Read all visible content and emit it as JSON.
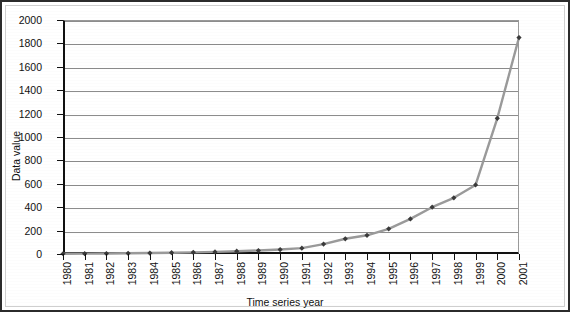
{
  "chart_data": {
    "type": "line",
    "title": "",
    "xlabel": "Time series year",
    "ylabel": "Data value",
    "xlim": [
      1980,
      2001
    ],
    "ylim": [
      0,
      2000
    ],
    "ytick_step": 200,
    "grid": true,
    "legend": "none",
    "marker": "diamond",
    "line_color": "#9a9a9a",
    "marker_color": "#3a3a3a",
    "grid_color": "#8c8c8c",
    "axis_color": "#111111",
    "categories": [
      "1980",
      "1981",
      "1982",
      "1983",
      "1984",
      "1985",
      "1986",
      "1987",
      "1988",
      "1989",
      "1990",
      "1991",
      "1992",
      "1993",
      "1994",
      "1995",
      "1996",
      "1997",
      "1998",
      "1999",
      "2000",
      "2001"
    ],
    "yticks": [
      0,
      200,
      400,
      600,
      800,
      1000,
      1200,
      1400,
      1600,
      1800,
      2000
    ],
    "values": [
      2,
      3,
      4,
      6,
      8,
      11,
      14,
      18,
      24,
      30,
      38,
      50,
      85,
      130,
      160,
      215,
      300,
      400,
      480,
      590,
      1160,
      1850
    ]
  }
}
